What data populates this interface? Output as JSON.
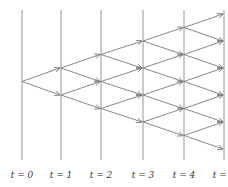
{
  "diagram": {
    "type": "recombining binomial tree",
    "time_labels": [
      "t = 0",
      "t = 1",
      "t = 2",
      "t = 3",
      "t = 4",
      "t = 5"
    ],
    "steps": 5,
    "colors": {
      "line": "#8a8a8a",
      "arrow": "#7a7a7a",
      "text": "#333333"
    }
  }
}
